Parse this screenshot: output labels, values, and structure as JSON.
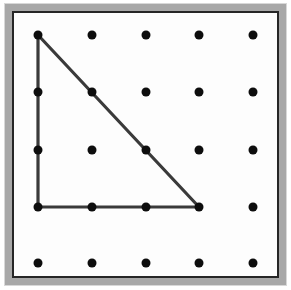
{
  "figure": {
    "canvas": {
      "width": 291,
      "height": 290
    }
  },
  "frame": {
    "outer_margin_color": "#ffffff",
    "bevel_color": "#a8a8a8",
    "bevel_highlight_color": "#d8d8d8",
    "inner_border_color": "#262626",
    "board_face_color": "#fdfdfd",
    "outer_rect": {
      "x": 4,
      "y": 3,
      "width": 283,
      "height": 283
    },
    "inner_rect": {
      "x": 11,
      "y": 10,
      "width": 269,
      "height": 269
    }
  },
  "grid": {
    "rows": 5,
    "columns": 5,
    "peg_count": 25,
    "peg_color": "#0d0d0d",
    "peg_diameter": 9,
    "column_spacing": 53.75,
    "row_spacing": 57,
    "origin": {
      "x": 38,
      "y": 35
    },
    "column_x": [
      38,
      92,
      146,
      199,
      253
    ],
    "row_y": [
      35,
      92,
      150,
      207,
      263
    ],
    "pegs": [
      {
        "row": 0,
        "col": 0,
        "x": 38,
        "y": 35,
        "on_band": true
      },
      {
        "row": 0,
        "col": 1,
        "x": 92,
        "y": 35,
        "on_band": false
      },
      {
        "row": 0,
        "col": 2,
        "x": 146,
        "y": 35,
        "on_band": false
      },
      {
        "row": 0,
        "col": 3,
        "x": 199,
        "y": 35,
        "on_band": false
      },
      {
        "row": 0,
        "col": 4,
        "x": 253,
        "y": 35,
        "on_band": false
      },
      {
        "row": 1,
        "col": 0,
        "x": 38,
        "y": 92,
        "on_band": true
      },
      {
        "row": 1,
        "col": 1,
        "x": 92,
        "y": 92,
        "on_band": true
      },
      {
        "row": 1,
        "col": 2,
        "x": 146,
        "y": 92,
        "on_band": false
      },
      {
        "row": 1,
        "col": 3,
        "x": 199,
        "y": 92,
        "on_band": false
      },
      {
        "row": 1,
        "col": 4,
        "x": 253,
        "y": 92,
        "on_band": false
      },
      {
        "row": 2,
        "col": 0,
        "x": 38,
        "y": 150,
        "on_band": true
      },
      {
        "row": 2,
        "col": 1,
        "x": 92,
        "y": 150,
        "on_band": false
      },
      {
        "row": 2,
        "col": 2,
        "x": 146,
        "y": 150,
        "on_band": true
      },
      {
        "row": 2,
        "col": 3,
        "x": 199,
        "y": 150,
        "on_band": false
      },
      {
        "row": 2,
        "col": 4,
        "x": 253,
        "y": 150,
        "on_band": false
      },
      {
        "row": 3,
        "col": 0,
        "x": 38,
        "y": 207,
        "on_band": true
      },
      {
        "row": 3,
        "col": 1,
        "x": 92,
        "y": 207,
        "on_band": true
      },
      {
        "row": 3,
        "col": 2,
        "x": 146,
        "y": 207,
        "on_band": true
      },
      {
        "row": 3,
        "col": 3,
        "x": 199,
        "y": 207,
        "on_band": true
      },
      {
        "row": 3,
        "col": 4,
        "x": 253,
        "y": 207,
        "on_band": false
      },
      {
        "row": 4,
        "col": 0,
        "x": 38,
        "y": 263,
        "on_band": false
      },
      {
        "row": 4,
        "col": 1,
        "x": 92,
        "y": 263,
        "on_band": false
      },
      {
        "row": 4,
        "col": 2,
        "x": 146,
        "y": 263,
        "on_band": false
      },
      {
        "row": 4,
        "col": 3,
        "x": 199,
        "y": 263,
        "on_band": false
      },
      {
        "row": 4,
        "col": 4,
        "x": 253,
        "y": 263,
        "on_band": false
      }
    ]
  },
  "band": {
    "shape": "right triangle",
    "stroke_color": "#3a3a3a",
    "stroke_width": 3.2,
    "vertices": [
      {
        "label": "top-left vertex",
        "row": 0,
        "col": 0,
        "x": 38,
        "y": 35
      },
      {
        "label": "bottom-left vertex",
        "row": 3,
        "col": 0,
        "x": 38,
        "y": 207
      },
      {
        "label": "bottom-right vertex",
        "row": 3,
        "col": 3,
        "x": 199,
        "y": 207
      }
    ],
    "path": "M 38 35 L 38 207 L 199 207 Z",
    "edges": [
      {
        "name": "vertical-leg",
        "from": "top-left vertex",
        "to": "bottom-left vertex",
        "units": 3
      },
      {
        "name": "horizontal-leg",
        "from": "bottom-left vertex",
        "to": "bottom-right vertex",
        "units": 3
      },
      {
        "name": "hypotenuse",
        "from": "bottom-right vertex",
        "to": "top-left vertex",
        "units": "3√2"
      }
    ]
  }
}
